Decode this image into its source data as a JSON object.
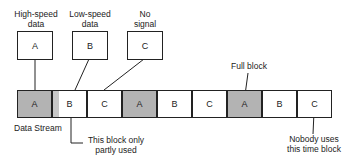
{
  "sources": [
    {
      "label_line1": "High-speed",
      "label_line2": "data",
      "letter": "A"
    },
    {
      "label_line1": "Low-speed",
      "label_line2": "data",
      "letter": "B"
    },
    {
      "label_line1": "No",
      "label_line2": "signal",
      "letter": "C"
    }
  ],
  "stream": {
    "label": "Data Stream",
    "blocks": [
      {
        "letter": "A",
        "state": "full"
      },
      {
        "letter": "B",
        "state": "partial"
      },
      {
        "letter": "C",
        "state": "empty"
      },
      {
        "letter": "A",
        "state": "full"
      },
      {
        "letter": "B",
        "state": "empty"
      },
      {
        "letter": "C",
        "state": "empty"
      },
      {
        "letter": "A",
        "state": "full"
      },
      {
        "letter": "B",
        "state": "empty"
      },
      {
        "letter": "C",
        "state": "empty"
      }
    ]
  },
  "annotations": {
    "full_block": "Full block",
    "partial_line1": "This block only",
    "partial_line2": "partly used",
    "unused_line1": "Nobody uses",
    "unused_line2": "this time block"
  },
  "colors": {
    "full_fill": "#b3b3b3",
    "partial_fill": "#c8c8c8",
    "stroke": "#222222"
  }
}
